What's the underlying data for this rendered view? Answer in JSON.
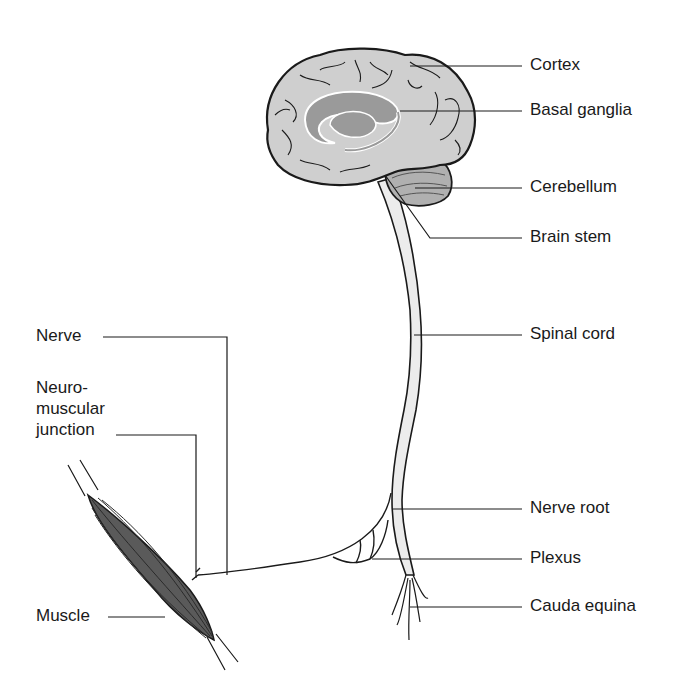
{
  "diagram": {
    "type": "anatomical-diagram",
    "colors": {
      "outline": "#1a1a1a",
      "brain_fill": "#cfcfcf",
      "basal_ganglia_fill": "#9a9a9a",
      "cerebellum_fill": "#b0b0b0",
      "spinal_cord_fill": "#ececec",
      "muscle_fill": "#5a5a5a",
      "background": "#ffffff"
    },
    "labels_right": [
      {
        "id": "cortex",
        "text": "Cortex"
      },
      {
        "id": "basal-ganglia",
        "text": "Basal ganglia"
      },
      {
        "id": "cerebellum",
        "text": "Cerebellum"
      },
      {
        "id": "brain-stem",
        "text": "Brain stem"
      },
      {
        "id": "spinal-cord",
        "text": "Spinal cord"
      },
      {
        "id": "nerve-root",
        "text": "Nerve root"
      },
      {
        "id": "plexus",
        "text": "Plexus"
      },
      {
        "id": "cauda-equina",
        "text": "Cauda equina"
      }
    ],
    "labels_left": [
      {
        "id": "nerve",
        "text": "Nerve"
      },
      {
        "id": "neuromuscular-junction",
        "text": "Neuro-\nmuscular\njunction"
      },
      {
        "id": "muscle",
        "text": "Muscle"
      }
    ]
  }
}
